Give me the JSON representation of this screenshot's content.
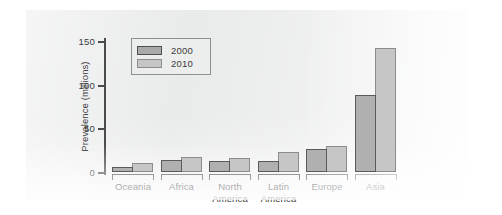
{
  "chart_data": {
    "type": "bar",
    "title": "",
    "xlabel": "",
    "ylabel": "Prevalence (millions)",
    "ylim": [
      0,
      150
    ],
    "yticks": [
      0,
      50,
      100,
      150
    ],
    "ytick_labels": [
      "0",
      "50",
      "100",
      "150"
    ],
    "grid": false,
    "legend_position": "upper-left-inside",
    "categories": [
      "Oceania",
      "Africa",
      "North America",
      "Latin America",
      "Europe",
      "Asia"
    ],
    "category_lines": [
      [
        "Oceania"
      ],
      [
        "Africa"
      ],
      [
        "North",
        "America"
      ],
      [
        "Latin",
        "America"
      ],
      [
        "Europe"
      ],
      [
        "Asia"
      ]
    ],
    "series": [
      {
        "name": "2000",
        "color": "#b0b0b0",
        "edge_color": "#5a5a5a",
        "values": [
          6,
          14,
          13,
          13,
          26,
          88
        ]
      },
      {
        "name": "2010",
        "color": "#c6c6c6",
        "edge_color": "#8c8c8c",
        "values": [
          10,
          17,
          16,
          23,
          30,
          142
        ]
      }
    ]
  },
  "legend": {
    "entries": [
      {
        "label": "2000"
      },
      {
        "label": "2010"
      }
    ]
  },
  "axis": {
    "y_title": "Prevalence (millions)",
    "tick_labels": [
      "150",
      "100",
      "50",
      "0"
    ]
  },
  "colors": {
    "panel_background": "#e9eaea",
    "page_background": "#ffffff",
    "axis": "#4b4b4b",
    "text": "#3a3a3a",
    "series_2000_fill": "#b0b0b0",
    "series_2000_edge": "#5a5a5a",
    "series_2010_fill": "#c6c6c6",
    "series_2010_edge": "#8c8c8c"
  }
}
